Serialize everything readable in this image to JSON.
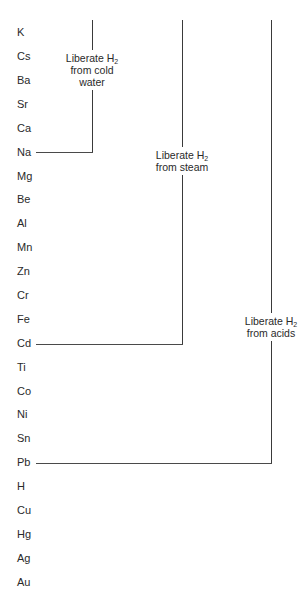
{
  "elements": [
    "K",
    "Cs",
    "Ba",
    "Sr",
    "Ca",
    "Na",
    "Mg",
    "Be",
    "Al",
    "Mn",
    "Zn",
    "Cr",
    "Fe",
    "Cd",
    "Ti",
    "Co",
    "Ni",
    "Sn",
    "Pb",
    "H",
    "Cu",
    "Hg",
    "Ag",
    "Au"
  ],
  "groups": [
    {
      "label_line1": "Liberate H",
      "label_sub": "2",
      "label_line2": "from cold",
      "label_line3": "water",
      "ends_at": "Na"
    },
    {
      "label_line1": "Liberate H",
      "label_sub": "2",
      "label_line2": "from steam",
      "ends_at": "Cd"
    },
    {
      "label_line1": "Liberate H",
      "label_sub": "2",
      "label_line2": "from acids",
      "ends_at": "Pb"
    }
  ],
  "colors": {
    "line": "#3a3a3a",
    "text": "#2a2a2a",
    "background": "#ffffff"
  }
}
